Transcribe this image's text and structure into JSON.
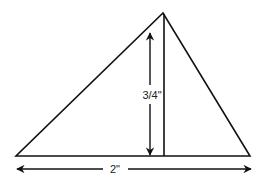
{
  "diagram": {
    "shape": "triangle",
    "vertices": {
      "left_base": [
        16,
        156
      ],
      "right_base": [
        250,
        156
      ],
      "apex": [
        163,
        13
      ]
    },
    "height_label": "3/4\"",
    "base_label": "2\"",
    "line_color": "#111111",
    "background": "#ffffff"
  }
}
